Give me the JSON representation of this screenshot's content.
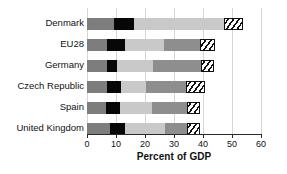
{
  "chart_data": {
    "type": "bar",
    "orientation": "horizontal",
    "stacked": true,
    "title": "",
    "subtitle": "",
    "xlabel": "Percent of GDP",
    "ylabel": "",
    "xlim": [
      0,
      60
    ],
    "xticks": [
      0,
      10,
      20,
      30,
      40,
      50,
      60
    ],
    "xticklabels": [
      "0",
      "10",
      "20",
      "30",
      "40",
      "50",
      "60"
    ],
    "grid": true,
    "grid_axis": "x",
    "legend": "none",
    "categories": [
      "Denmark",
      "EU28",
      "Germany",
      "Czech Republic",
      "Spain",
      "United Kingdom"
    ],
    "series": [
      {
        "name": "segment-1",
        "style": "dark-gray",
        "color": "#7d7d7d",
        "values": [
          9.3,
          7.0,
          7.0,
          7.0,
          6.5,
          8.0
        ]
      },
      {
        "name": "segment-2",
        "style": "black",
        "color": "#070707",
        "values": [
          6.9,
          6.0,
          3.3,
          4.7,
          4.9,
          5.0
        ]
      },
      {
        "name": "segment-3",
        "style": "light-gray",
        "color": "#c9c9c9",
        "values": [
          31.0,
          13.5,
          12.5,
          8.5,
          11.0,
          14.0
        ]
      },
      {
        "name": "segment-4",
        "style": "medium-gray",
        "color": "#8e8e8e",
        "values": [
          0.0,
          12.5,
          16.5,
          14.0,
          12.0,
          7.5
        ]
      },
      {
        "name": "segment-5",
        "style": "hatched",
        "color": "#ffffff",
        "values": [
          6.5,
          5.0,
          4.5,
          6.5,
          4.5,
          4.5
        ]
      }
    ],
    "totals": [
      53.7,
      44.0,
      43.8,
      40.7,
      38.9,
      39.0
    ]
  },
  "axis": {
    "x_title": "Percent of GDP"
  },
  "colors": {
    "background": "#ffffff",
    "axis": "#2a2a2a",
    "grid": "#d6d6d6",
    "text": "#111111"
  }
}
